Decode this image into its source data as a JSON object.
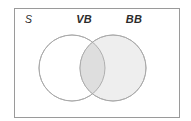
{
  "figure": {
    "kind": "venn-diagram",
    "set_count": 2,
    "background_color": "#ffffff"
  },
  "universe": {
    "label": "S",
    "name": "universal-set",
    "border_color": "#9a9a9a",
    "fill_color": "#ffffff",
    "rect": {
      "x": 14,
      "y": 8,
      "width": 166,
      "height": 110
    }
  },
  "sets": [
    {
      "id": "VB",
      "label": "VB",
      "label_x": 84,
      "label_y": 23,
      "shaded": false,
      "fill_color": "#ffffff",
      "stroke_color": "#a8a8a8",
      "cx": 72,
      "cy": 68,
      "r": 33
    },
    {
      "id": "BB",
      "label": "BB",
      "label_x": 134,
      "label_y": 23,
      "shaded": true,
      "fill_color": "#eeeeee",
      "stroke_color": "#a8a8a8",
      "cx": 113,
      "cy": 68,
      "r": 33
    }
  ],
  "regions": {
    "intersection": {
      "label": "VB and BB overlap",
      "shaded": true,
      "fill_color": "#dedede"
    },
    "vb_only": {
      "label": "VB only",
      "shaded": false,
      "fill_color": "#ffffff"
    },
    "bb_only": {
      "label": "BB only",
      "shaded": true,
      "fill_color": "#eeeeee"
    },
    "outside": {
      "label": "outside both sets",
      "shaded": false,
      "fill_color": "#ffffff"
    }
  }
}
